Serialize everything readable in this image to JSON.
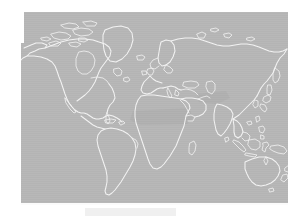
{
  "document": {
    "title": "World Map",
    "kind": "grayscale-world-map-figure"
  },
  "figure": {
    "name": "world-map",
    "projection": "equirectangular",
    "ocean_color": "#b4b4b4",
    "coastline_color": "#f2f2f2",
    "landmass_shade_color": "#a9a9a9",
    "page_background_color": "#ffffff",
    "frame": {
      "left": 21,
      "top": 12,
      "width": 267,
      "height": 191
    }
  },
  "caption": {
    "bar_color": "#f0f0f0",
    "text": ""
  },
  "regions": [
    {
      "id": "north-america",
      "label": "North America"
    },
    {
      "id": "greenland",
      "label": "Greenland"
    },
    {
      "id": "central-america",
      "label": "Central America"
    },
    {
      "id": "south-america",
      "label": "South America"
    },
    {
      "id": "europe",
      "label": "Europe"
    },
    {
      "id": "scandinavia",
      "label": "Scandinavia"
    },
    {
      "id": "africa",
      "label": "Africa"
    },
    {
      "id": "madagascar",
      "label": "Madagascar"
    },
    {
      "id": "middle-east",
      "label": "Middle East"
    },
    {
      "id": "russia-siberia",
      "label": "Russia and Siberia"
    },
    {
      "id": "india",
      "label": "India"
    },
    {
      "id": "southeast-asia",
      "label": "Southeast Asia"
    },
    {
      "id": "east-asia",
      "label": "East Asia"
    },
    {
      "id": "japan",
      "label": "Japan"
    },
    {
      "id": "indonesia",
      "label": "Indonesia"
    },
    {
      "id": "australia",
      "label": "Australia"
    },
    {
      "id": "new-zealand",
      "label": "New Zealand"
    },
    {
      "id": "arctic-archipelago",
      "label": "Arctic Archipelago"
    }
  ]
}
